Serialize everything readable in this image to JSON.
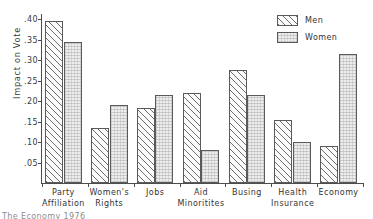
{
  "chart_data": {
    "type": "bar",
    "title": "",
    "xlabel": "",
    "ylabel": "Impact on Vote",
    "ylim": [
      0,
      0.4125
    ],
    "grid": false,
    "legend_position": "top-right",
    "ytick_labels": [
      ".40",
      ".35",
      ".30",
      ".25",
      ".20",
      ".15",
      ".10",
      ".05"
    ],
    "ytick_values": [
      0.4,
      0.35,
      0.3,
      0.25,
      0.2,
      0.15,
      0.1,
      0.05
    ],
    "categories": [
      "Party Affiliation",
      "Women's Rights",
      "Jobs",
      "Aid Minoritites",
      "Busing",
      "Health Insurance",
      "Economy"
    ],
    "category_lines": [
      [
        "Party",
        "Affiliation"
      ],
      [
        "Women's",
        "Rights"
      ],
      [
        "Jobs",
        ""
      ],
      [
        "Aid",
        "Minoritites"
      ],
      [
        "Busing",
        ""
      ],
      [
        "Health",
        "Insurance"
      ],
      [
        "Economy",
        ""
      ]
    ],
    "series": [
      {
        "name": "Men",
        "fill": "diagonal-hatch",
        "values": [
          0.395,
          0.135,
          0.183,
          0.22,
          0.275,
          0.155,
          0.09
        ]
      },
      {
        "name": "Women",
        "fill": "light-stipple",
        "values": [
          0.343,
          0.19,
          0.215,
          0.08,
          0.215,
          0.1,
          0.315
        ]
      }
    ]
  },
  "legend": {
    "items": [
      {
        "label": "Men",
        "fill": "diagonal-hatch"
      },
      {
        "label": "Women",
        "fill": "light-stipple"
      }
    ]
  },
  "caption": {
    "text": "The Economy 1976"
  },
  "colors": {
    "axis": "#4d4d4d",
    "bar_outline": "#5a5a5a",
    "men_hatch": "#6e6e6e",
    "women_fill": "#ededed",
    "text": "#333333",
    "background": "#ffffff"
  }
}
